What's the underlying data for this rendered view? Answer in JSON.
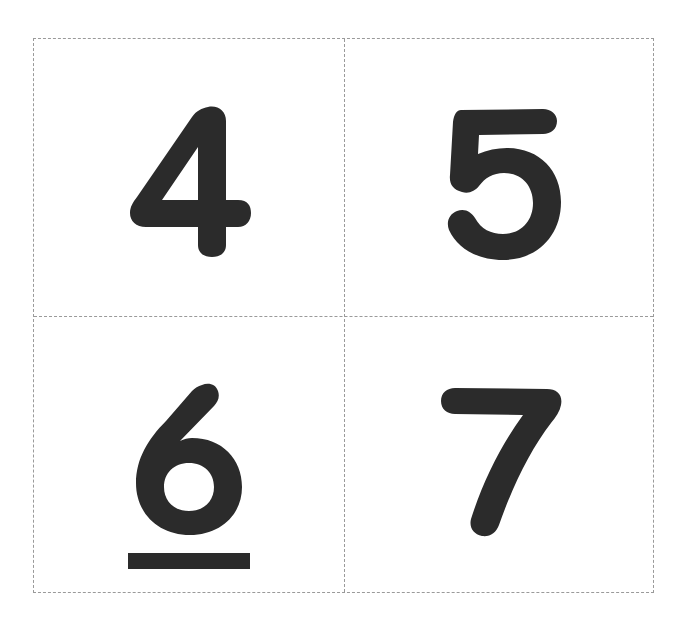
{
  "page": {
    "background": "#ffffff",
    "border_color": "#9a9a9a",
    "ink_color": "#2b2b2b"
  },
  "cards": [
    {
      "position": "top-left",
      "digit": "4",
      "underlined": false
    },
    {
      "position": "top-right",
      "digit": "5",
      "underlined": false
    },
    {
      "position": "bottom-left",
      "digit": "6",
      "underlined": true
    },
    {
      "position": "bottom-right",
      "digit": "7",
      "underlined": false
    }
  ]
}
